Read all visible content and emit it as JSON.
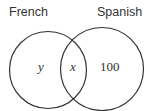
{
  "diagram": {
    "type": "venn",
    "sets": [
      {
        "label": "French"
      },
      {
        "label": "Spanish"
      }
    ],
    "regions": {
      "french_only": "y",
      "both": "x",
      "spanish_only": "100"
    }
  }
}
